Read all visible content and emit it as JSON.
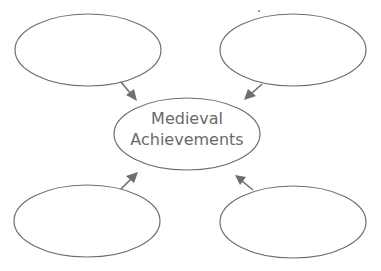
{
  "diagram": {
    "type": "concept-web",
    "center": {
      "line1": "Medieval",
      "line2": "Achievements"
    },
    "outer_nodes": [
      {
        "position": "top-left",
        "text": ""
      },
      {
        "position": "top-right",
        "text": ""
      },
      {
        "position": "bottom-left",
        "text": ""
      },
      {
        "position": "bottom-right",
        "text": ""
      }
    ],
    "colors": {
      "stroke": "#6e6e6e",
      "text": "#6a6a6a",
      "background": "#ffffff"
    }
  }
}
